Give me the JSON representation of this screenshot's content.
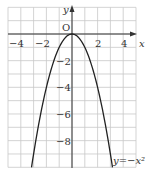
{
  "chart_data": {
    "type": "line",
    "title": "",
    "xlabel": "x",
    "ylabel": "y",
    "origin_label": "O",
    "xlim": [
      -5,
      5
    ],
    "ylim": [
      -10,
      2
    ],
    "grid": true,
    "x_ticks": [
      -4,
      -2,
      2,
      4
    ],
    "x_tick_labels": [
      "−4",
      "−2",
      "2",
      "4"
    ],
    "y_ticks": [
      -2,
      -4,
      -6,
      -8
    ],
    "y_tick_labels": [
      "−2",
      "−4",
      "−6",
      "−8"
    ],
    "series": [
      {
        "name": "y=−x²",
        "function": "y = -x^2",
        "x": [
          -3.16,
          -3,
          -2,
          -1,
          0,
          1,
          2,
          3,
          3.16
        ],
        "y": [
          -10,
          -9,
          -4,
          -1,
          0,
          -1,
          -4,
          -9,
          -10
        ]
      }
    ],
    "annotations": [
      {
        "text": "y=−x²",
        "position": "bottom-right of curve"
      }
    ],
    "colors": {
      "curve": "#222222",
      "grid": "#c8c8c8",
      "axis": "#333333"
    }
  }
}
